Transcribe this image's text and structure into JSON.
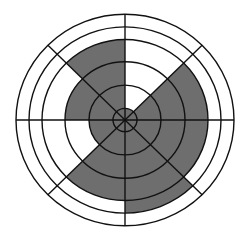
{
  "diagram": {
    "type": "polar-grid-shaded-sectors",
    "center": [
      125,
      120
    ],
    "scale_y": 0.97,
    "rings": [
      12,
      36,
      60,
      83,
      96,
      109
    ],
    "spokes_deg": [
      0,
      45,
      90,
      135,
      180,
      225,
      270,
      315
    ],
    "colors": {
      "fill": "#6e6e6e",
      "stroke": "#111111",
      "background": "#ffffff"
    },
    "sectors": [
      {
        "label": "octant-0-45",
        "start_deg": 0,
        "end_deg": 45,
        "shaded_radius": 83
      },
      {
        "label": "octant-45-90",
        "start_deg": 45,
        "end_deg": 90,
        "shaded_radius": 12
      },
      {
        "label": "octant-90-135",
        "start_deg": 90,
        "end_deg": 135,
        "shaded_radius": 83
      },
      {
        "label": "octant-135-180",
        "start_deg": 135,
        "end_deg": 180,
        "shaded_radius": 60
      },
      {
        "label": "octant-180-225",
        "start_deg": 180,
        "end_deg": 225,
        "shaded_radius": 36
      },
      {
        "label": "octant-225-270",
        "start_deg": 225,
        "end_deg": 270,
        "shaded_radius": 83
      },
      {
        "label": "octant-270-315",
        "start_deg": 270,
        "end_deg": 315,
        "shaded_radius": 96
      },
      {
        "label": "octant-315-360",
        "start_deg": 315,
        "end_deg": 360,
        "shaded_radius": 83
      }
    ]
  }
}
